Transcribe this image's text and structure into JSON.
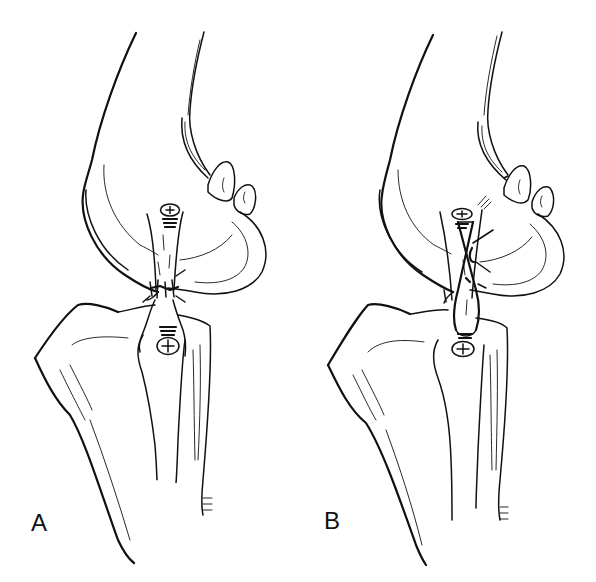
{
  "figure": {
    "background_color": "#ffffff",
    "ink_color": "#111111",
    "panels": [
      {
        "id": "A",
        "label": "A",
        "screws": 2,
        "graft": "single strand tied at joint line"
      },
      {
        "id": "B",
        "label": "B",
        "screws": 2,
        "graft": "crossed figure-of-eight strand"
      }
    ]
  }
}
